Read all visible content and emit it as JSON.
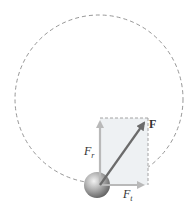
{
  "diagram": {
    "labels": {
      "force": "F",
      "radial_main": "F",
      "radial_sub": "r",
      "tangential_main": "F",
      "tangential_sub": "t"
    },
    "colors": {
      "circle": "#8a8a8a",
      "rectangle_fill": "#eef1f3",
      "rectangle_border": "#9a9a9a",
      "force_arrow": "#6b6b6b",
      "component_arrow": "#b9b9b9",
      "sphere": "#9a9a9a",
      "label": "#333333"
    },
    "geometry": {
      "circle": {
        "cx": 99,
        "cy": 99,
        "r": 84
      },
      "origin": {
        "x": 100,
        "y": 185
      },
      "radial_tip": {
        "x": 100,
        "y": 118
      },
      "tangential_tip": {
        "x": 148,
        "y": 185
      },
      "force_tip": {
        "x": 147,
        "y": 120
      },
      "sphere": {
        "cx": 97,
        "cy": 185,
        "r": 13
      }
    }
  }
}
